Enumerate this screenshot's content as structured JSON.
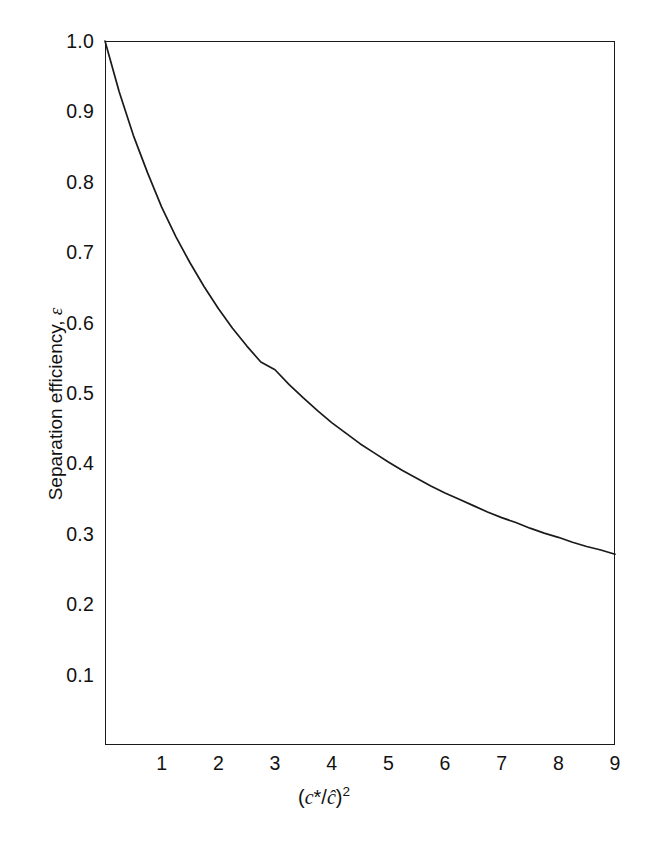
{
  "chart_data": {
    "type": "line",
    "title": "",
    "subtitle": "",
    "xlabel": "(c*/ĉ)²",
    "xlabel_parts": {
      "open_paren": "(",
      "numerator": "c",
      "star": "*",
      "slash": "/",
      "denominator": "ĉ",
      "close_paren": ")",
      "exponent": "2"
    },
    "ylabel": "Separation efficiency, ε",
    "ylabel_parts": {
      "text": "Separation efficiency,",
      "symbol": "ε"
    },
    "xlim": [
      0,
      9
    ],
    "ylim": [
      0,
      1.0
    ],
    "grid": false,
    "legend": false,
    "legend_position": "none",
    "line_color": "#1a1a1a",
    "frame_color": "#1a1a1a",
    "background_color": "#ffffff",
    "xticks": [
      0,
      1,
      2,
      3,
      4,
      5,
      6,
      7,
      8,
      9
    ],
    "xtick_labels": [
      "",
      "1",
      "2",
      "3",
      "4",
      "5",
      "6",
      "7",
      "8",
      "9"
    ],
    "yticks": [
      0.1,
      0.2,
      0.3,
      0.4,
      0.5,
      0.6,
      0.7,
      0.8,
      0.9,
      1.0
    ],
    "ytick_labels": [
      "0.1",
      "0.2",
      "0.3",
      "0.4",
      "0.5",
      "0.6",
      "0.7",
      "0.8",
      "0.9",
      "1.0"
    ],
    "series": [
      {
        "name": "separation efficiency",
        "x": [
          0,
          0.25,
          0.5,
          0.75,
          1,
          1.25,
          1.5,
          1.75,
          2,
          2.25,
          2.5,
          2.75,
          3,
          3.25,
          3.5,
          3.75,
          4,
          4.25,
          4.5,
          4.75,
          5,
          5.25,
          5.5,
          5.75,
          6,
          6.25,
          6.5,
          6.75,
          7,
          7.25,
          7.5,
          7.75,
          8,
          8.25,
          8.5,
          8.75,
          9
        ],
        "values": [
          1.0,
          0.928,
          0.866,
          0.813,
          0.764,
          0.722,
          0.685,
          0.651,
          0.62,
          0.592,
          0.567,
          0.544,
          0.533,
          0.512,
          0.493,
          0.475,
          0.458,
          0.443,
          0.428,
          0.415,
          0.402,
          0.39,
          0.379,
          0.368,
          0.358,
          0.349,
          0.34,
          0.331,
          0.323,
          0.316,
          0.308,
          0.301,
          0.295,
          0.288,
          0.282,
          0.277,
          0.271
        ]
      }
    ]
  }
}
